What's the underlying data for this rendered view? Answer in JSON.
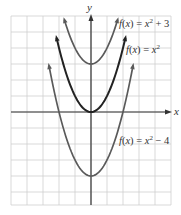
{
  "chart_data": {
    "type": "line",
    "title": "",
    "xlabel": "x",
    "ylabel": "y",
    "xlim": [
      -5,
      5
    ],
    "ylim": [
      -5.5,
      6
    ],
    "grid": true,
    "unit_px": 16,
    "origin_px": [
      91,
      112
    ],
    "series": [
      {
        "name": "f(x) = x^2 + 3",
        "shift": 3,
        "color": "#5a5a5a",
        "label_parts": [
          "f",
          "(",
          "x",
          ") = ",
          "x",
          "2",
          " + 3"
        ]
      },
      {
        "name": "f(x) = x^2",
        "shift": 0,
        "color": "#222222",
        "label_parts": [
          "f",
          "(",
          "x",
          ") = ",
          "x",
          "2",
          ""
        ]
      },
      {
        "name": "f(x) = x^2 - 4",
        "shift": -4,
        "color": "#5a5a5a",
        "label_parts": [
          "f",
          "(",
          "x",
          ") = ",
          "x",
          "2",
          " − 4"
        ]
      }
    ],
    "labels": {
      "s0": "f(x) = x² + 3",
      "s1": "f(x) = x²",
      "s2": "f(x) = x² − 4"
    },
    "axis_labels": {
      "x": "x",
      "y": "y"
    }
  }
}
